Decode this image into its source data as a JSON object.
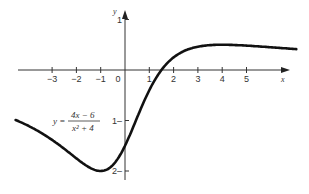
{
  "chart_data": {
    "type": "line",
    "title": "",
    "equation": {
      "lhs": "y =",
      "numerator": "4x − 6",
      "denominator": "x² + 4"
    },
    "xlabel": "x",
    "ylabel": "y",
    "xlim": [
      -5,
      7
    ],
    "ylim": [
      -2.3,
      1
    ],
    "x_ticks": [
      "−3",
      "−2",
      "−1",
      "0",
      "1",
      "2",
      "3",
      "4",
      "5"
    ],
    "y_ticks": [
      {
        "value": 1,
        "label": "1"
      },
      {
        "value": -1,
        "label": "1–"
      },
      {
        "value": -2,
        "label": "2–"
      }
    ],
    "grid": false,
    "series": [
      {
        "name": "y = (4x−6)/(x²+4)",
        "x": [
          -4.5,
          -4,
          -3,
          -2,
          -1,
          -0.5,
          0,
          0.5,
          1,
          1.5,
          2,
          3,
          4,
          5,
          7
        ],
        "values": [
          -0.98,
          -1.1,
          -1.38,
          -1.75,
          -2.0,
          -1.88,
          -1.5,
          -0.94,
          -0.4,
          0,
          0.25,
          0.46,
          0.5,
          0.48,
          0.42
        ]
      }
    ]
  }
}
